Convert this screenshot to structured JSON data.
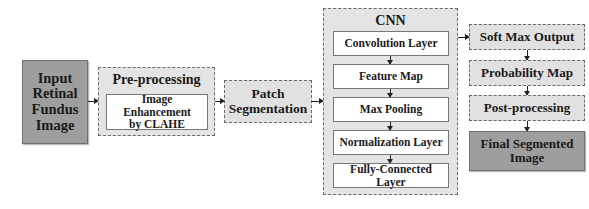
{
  "diagram": {
    "input": {
      "label": "Input Retinal Fundus Image",
      "lines": [
        "Input",
        "Retinal",
        "Fundus",
        "Image"
      ]
    },
    "preprocessing": {
      "title": "Pre-processing",
      "inner": {
        "label": "Image Enhancement by CLAHE",
        "lines": [
          "Image Enhancement",
          "by CLAHE"
        ]
      }
    },
    "patch": {
      "label": "Patch Segmentation",
      "lines": [
        "Patch",
        "Segmentation"
      ]
    },
    "cnn": {
      "title": "CNN",
      "layers": [
        {
          "label": "Convolution Layer"
        },
        {
          "label": "Feature Map"
        },
        {
          "label": "Max Pooling"
        },
        {
          "label": "Normalization Layer"
        },
        {
          "label": "Fully-Connected Layer"
        }
      ]
    },
    "output_chain": [
      {
        "label": "Soft Max Output"
      },
      {
        "label": "Probability Map"
      },
      {
        "label": "Post-processing"
      }
    ],
    "final": {
      "label": "Final Segmented Image",
      "lines": [
        "Final Segmented",
        "Image"
      ]
    },
    "colors": {
      "terminal_fill": "#9e9e9e",
      "dashed_fill": "#e1e1e1",
      "inner_fill": "#ffffff",
      "border": "#6a6a6a",
      "arrow": "#222222"
    }
  }
}
